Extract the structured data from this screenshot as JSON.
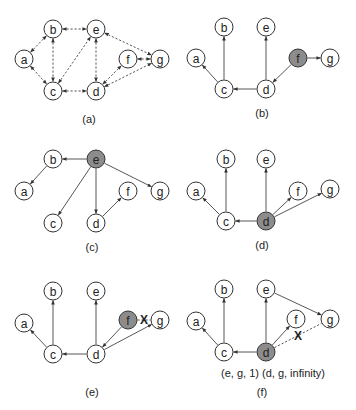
{
  "colors": {
    "node_fill": "#ffffff",
    "highlight_fill": "#8c8c8c",
    "stroke": "#333333",
    "edge": "#444444"
  },
  "node_radius": 9,
  "panels": [
    {
      "id": "a",
      "caption": "(a)",
      "caption_pos": [
        89,
        123
      ],
      "nodes": [
        {
          "id": "a",
          "label": "a",
          "x": 24,
          "y": 59
        },
        {
          "id": "b",
          "label": "b",
          "x": 53,
          "y": 29
        },
        {
          "id": "e",
          "label": "e",
          "x": 96,
          "y": 29
        },
        {
          "id": "c",
          "label": "c",
          "x": 53,
          "y": 91
        },
        {
          "id": "d",
          "label": "d",
          "x": 96,
          "y": 91
        },
        {
          "id": "f",
          "label": "f",
          "x": 128,
          "y": 59
        },
        {
          "id": "g",
          "label": "g",
          "x": 160,
          "y": 59
        }
      ],
      "edges": [
        {
          "from": "a",
          "to": "b",
          "style": "dashed",
          "bidirectional": true
        },
        {
          "from": "a",
          "to": "c",
          "style": "dashed",
          "bidirectional": true
        },
        {
          "from": "b",
          "to": "e",
          "style": "dashed",
          "bidirectional": true
        },
        {
          "from": "b",
          "to": "c",
          "style": "dashed",
          "bidirectional": true
        },
        {
          "from": "c",
          "to": "e",
          "style": "dashed",
          "bidirectional": true
        },
        {
          "from": "c",
          "to": "d",
          "style": "dashed",
          "bidirectional": true
        },
        {
          "from": "e",
          "to": "d",
          "style": "dashed",
          "bidirectional": true
        },
        {
          "from": "e",
          "to": "g",
          "style": "dashed",
          "bidirectional": true
        },
        {
          "from": "d",
          "to": "f",
          "style": "dashed",
          "bidirectional": true
        },
        {
          "from": "f",
          "to": "g",
          "style": "dashed",
          "bidirectional": true
        },
        {
          "from": "d",
          "to": "g",
          "style": "dashed",
          "bidirectional": true
        }
      ]
    },
    {
      "id": "b",
      "caption": "(b)",
      "caption_pos": [
        262,
        117
      ],
      "nodes": [
        {
          "id": "a",
          "label": "a",
          "x": 196,
          "y": 58
        },
        {
          "id": "b",
          "label": "b",
          "x": 224,
          "y": 27
        },
        {
          "id": "e",
          "label": "e",
          "x": 266,
          "y": 27
        },
        {
          "id": "c",
          "label": "c",
          "x": 224,
          "y": 89
        },
        {
          "id": "d",
          "label": "d",
          "x": 266,
          "y": 89
        },
        {
          "id": "f",
          "label": "f",
          "x": 298,
          "y": 58,
          "highlight": true
        },
        {
          "id": "g",
          "label": "g",
          "x": 330,
          "y": 58
        }
      ],
      "edges": [
        {
          "from": "c",
          "to": "a",
          "style": "solid"
        },
        {
          "from": "c",
          "to": "b",
          "style": "solid"
        },
        {
          "from": "d",
          "to": "c",
          "style": "solid"
        },
        {
          "from": "d",
          "to": "e",
          "style": "solid"
        },
        {
          "from": "f",
          "to": "d",
          "style": "solid"
        },
        {
          "from": "f",
          "to": "g",
          "style": "solid"
        }
      ]
    },
    {
      "id": "c",
      "caption": "(c)",
      "caption_pos": [
        92,
        251
      ],
      "nodes": [
        {
          "id": "a",
          "label": "a",
          "x": 24,
          "y": 191
        },
        {
          "id": "b",
          "label": "b",
          "x": 53,
          "y": 159
        },
        {
          "id": "e",
          "label": "e",
          "x": 96,
          "y": 159,
          "highlight": true
        },
        {
          "id": "c",
          "label": "c",
          "x": 53,
          "y": 223
        },
        {
          "id": "d",
          "label": "d",
          "x": 96,
          "y": 223
        },
        {
          "id": "f",
          "label": "f",
          "x": 128,
          "y": 191
        },
        {
          "id": "g",
          "label": "g",
          "x": 160,
          "y": 191
        }
      ],
      "edges": [
        {
          "from": "e",
          "to": "b",
          "style": "solid"
        },
        {
          "from": "b",
          "to": "a",
          "style": "solid"
        },
        {
          "from": "e",
          "to": "c",
          "style": "solid"
        },
        {
          "from": "e",
          "to": "d",
          "style": "solid"
        },
        {
          "from": "e",
          "to": "g",
          "style": "solid"
        },
        {
          "from": "d",
          "to": "f",
          "style": "solid"
        }
      ]
    },
    {
      "id": "d",
      "caption": "(d)",
      "caption_pos": [
        262,
        249
      ],
      "nodes": [
        {
          "id": "a",
          "label": "a",
          "x": 196,
          "y": 191
        },
        {
          "id": "b",
          "label": "b",
          "x": 226,
          "y": 159
        },
        {
          "id": "e",
          "label": "e",
          "x": 266,
          "y": 159
        },
        {
          "id": "c",
          "label": "c",
          "x": 226,
          "y": 221
        },
        {
          "id": "d",
          "label": "d",
          "x": 266,
          "y": 221,
          "highlight": true
        },
        {
          "id": "f",
          "label": "f",
          "x": 298,
          "y": 191
        },
        {
          "id": "g",
          "label": "g",
          "x": 330,
          "y": 189
        }
      ],
      "edges": [
        {
          "from": "c",
          "to": "a",
          "style": "solid"
        },
        {
          "from": "c",
          "to": "b",
          "style": "solid"
        },
        {
          "from": "d",
          "to": "c",
          "style": "solid"
        },
        {
          "from": "d",
          "to": "e",
          "style": "solid"
        },
        {
          "from": "d",
          "to": "f",
          "style": "solid"
        },
        {
          "from": "d",
          "to": "g",
          "style": "solid"
        }
      ]
    },
    {
      "id": "e",
      "caption": "(e)",
      "caption_pos": [
        92,
        396
      ],
      "nodes": [
        {
          "id": "a",
          "label": "a",
          "x": 24,
          "y": 323
        },
        {
          "id": "b",
          "label": "b",
          "x": 53,
          "y": 291
        },
        {
          "id": "e",
          "label": "e",
          "x": 96,
          "y": 291
        },
        {
          "id": "c",
          "label": "c",
          "x": 53,
          "y": 354
        },
        {
          "id": "d",
          "label": "d",
          "x": 96,
          "y": 354
        },
        {
          "id": "f",
          "label": "f",
          "x": 128,
          "y": 320,
          "highlight": true
        },
        {
          "id": "g",
          "label": "g",
          "x": 160,
          "y": 320
        }
      ],
      "edges": [
        {
          "from": "c",
          "to": "a",
          "style": "solid"
        },
        {
          "from": "c",
          "to": "b",
          "style": "solid"
        },
        {
          "from": "d",
          "to": "c",
          "style": "solid"
        },
        {
          "from": "d",
          "to": "e",
          "style": "solid"
        },
        {
          "from": "f",
          "to": "d",
          "style": "solid"
        },
        {
          "from": "d",
          "to": "g",
          "style": "solid"
        },
        {
          "from": "f",
          "to": "g",
          "style": "dashed",
          "arrow": false,
          "cut": true
        }
      ]
    },
    {
      "id": "f",
      "caption": "(f)",
      "caption_pos": [
        262,
        396
      ],
      "note": "(e, g, 1) (d, g, infinity)",
      "note_pos": [
        273,
        377
      ],
      "nodes": [
        {
          "id": "a",
          "label": "a",
          "x": 196,
          "y": 321
        },
        {
          "id": "b",
          "label": "b",
          "x": 224,
          "y": 289
        },
        {
          "id": "e",
          "label": "e",
          "x": 266,
          "y": 289
        },
        {
          "id": "c",
          "label": "c",
          "x": 224,
          "y": 352
        },
        {
          "id": "d",
          "label": "d",
          "x": 266,
          "y": 352,
          "highlight": true
        },
        {
          "id": "f",
          "label": "f",
          "x": 296,
          "y": 319
        },
        {
          "id": "g",
          "label": "g",
          "x": 330,
          "y": 319
        }
      ],
      "edges": [
        {
          "from": "c",
          "to": "a",
          "style": "solid"
        },
        {
          "from": "c",
          "to": "b",
          "style": "solid"
        },
        {
          "from": "d",
          "to": "c",
          "style": "solid"
        },
        {
          "from": "d",
          "to": "e",
          "style": "solid"
        },
        {
          "from": "d",
          "to": "f",
          "style": "solid"
        },
        {
          "from": "e",
          "to": "g",
          "style": "solid"
        },
        {
          "from": "d",
          "to": "g",
          "style": "dashed",
          "arrow": false,
          "cut": true
        }
      ]
    }
  ]
}
